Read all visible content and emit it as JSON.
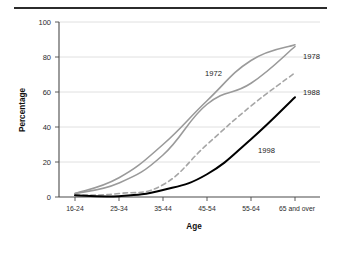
{
  "figure": {
    "top_rule": "horizontal-rule",
    "background_color": "#ffffff"
  },
  "chart_data": {
    "type": "line",
    "title": "",
    "subtitle": "",
    "xlabel": "Age",
    "ylabel": "Percentage",
    "categories": [
      "16-24",
      "25-34",
      "35-44",
      "45-54",
      "55-64",
      "65 and over"
    ],
    "ylim": [
      0,
      100
    ],
    "yticks": [
      0,
      20,
      40,
      60,
      80,
      100
    ],
    "ytick_labels": [
      "0",
      "20",
      "40",
      "60",
      "80",
      "100"
    ],
    "grid": true,
    "grid_axis": "y",
    "legend_position": "inline-annotations",
    "series": [
      {
        "name": "1972",
        "label": "1972",
        "color": "#9a9a9a",
        "style": "solid",
        "width": 1.6,
        "values": [
          2,
          11,
          30,
          55,
          78,
          87
        ],
        "annotation": {
          "text": "1972",
          "x_px": 205,
          "y_px": 76
        }
      },
      {
        "name": "1978",
        "label": "1978",
        "color": "#9a9a9a",
        "style": "solid",
        "width": 1.6,
        "values": [
          2,
          8,
          24,
          53,
          65,
          86
        ],
        "annotation": {
          "text": "1978",
          "x_px": 303,
          "y_px": 59
        }
      },
      {
        "name": "1988",
        "label": "1988",
        "color": "#a6a6a6",
        "style": "dashed",
        "width": 1.6,
        "values": [
          1,
          2,
          7,
          30,
          52,
          71
        ],
        "annotation": {
          "text": "1988",
          "x_px": 303,
          "y_px": 95
        }
      },
      {
        "name": "1998",
        "label": "1998",
        "color": "#000000",
        "style": "solid",
        "width": 2.0,
        "values": [
          1,
          0.5,
          4,
          13,
          33,
          57
        ],
        "annotation": {
          "text": "1998",
          "x_px": 258,
          "y_px": 153
        }
      }
    ]
  },
  "axes": {
    "y_axis_name": "percentage-axis",
    "x_axis_name": "age-axis"
  }
}
